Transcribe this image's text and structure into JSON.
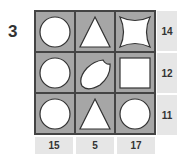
{
  "puzzle_number": "3",
  "grid": [
    [
      "circle",
      "triangle",
      "star4"
    ],
    [
      "circle",
      "bitten-oval",
      "square"
    ],
    [
      "circle",
      "triangle",
      "circle"
    ]
  ],
  "row_totals": [
    "14",
    "12",
    "11"
  ],
  "column_totals": [
    "15",
    "5",
    "17"
  ],
  "colors": {
    "cell_bg": "#a6a6a6",
    "label_bg": "#e6e6e6",
    "border": "#444444"
  }
}
